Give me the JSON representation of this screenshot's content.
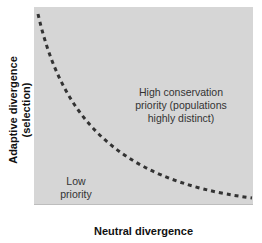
{
  "diagram": {
    "x_axis_label": "Neutral divergence",
    "y_axis_label_line1": "Adaptive divergence",
    "y_axis_label_line2": "(selection)",
    "regions": {
      "high": {
        "line1": "High conservation",
        "line2": "priority (populations",
        "line3": "highly distinct)"
      },
      "low": {
        "line1": "Low",
        "line2": "priority"
      }
    },
    "colors": {
      "background": "#d6d6d6",
      "curve": "#333333"
    },
    "curve_style": "dashed"
  }
}
